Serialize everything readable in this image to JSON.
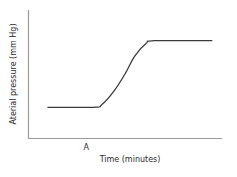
{
  "chart_data": {
    "type": "line",
    "title": "",
    "xlabel": "Time (minutes)",
    "ylabel": "Aterial pressure (mm Hg)",
    "x_tick_labels": [
      {
        "x": 3,
        "label": "A"
      }
    ],
    "xlim": [
      0,
      10
    ],
    "ylim": [
      0,
      10
    ],
    "grid": false,
    "legend": null,
    "series": [
      {
        "name": "arterial pressure",
        "points": [
          [
            1.0,
            2.4
          ],
          [
            3.4,
            2.4
          ],
          [
            3.8,
            2.6
          ],
          [
            4.4,
            3.6
          ],
          [
            5.0,
            5.0
          ],
          [
            5.5,
            6.4
          ],
          [
            6.1,
            7.4
          ],
          [
            6.5,
            7.6
          ],
          [
            9.5,
            7.6
          ]
        ]
      }
    ]
  }
}
